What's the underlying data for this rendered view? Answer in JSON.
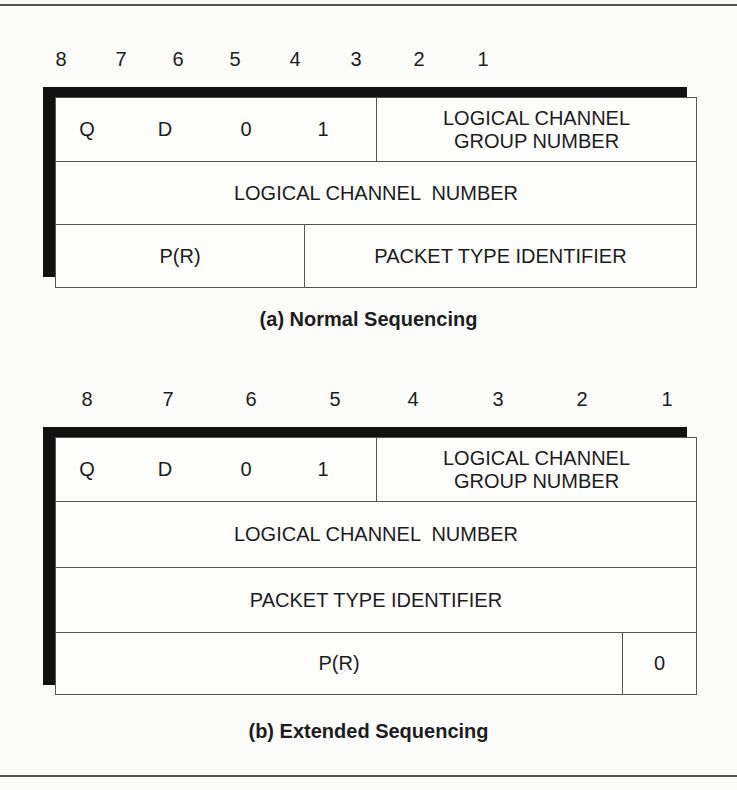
{
  "figure": {
    "bit_positions": [
      "8",
      "7",
      "6",
      "5",
      "4",
      "3",
      "2",
      "1"
    ],
    "normal": {
      "caption": "(a) Normal Sequencing",
      "row1": {
        "q": "Q",
        "d": "D",
        "bit6": "0",
        "bit5": "1",
        "group_label_line1": "LOGICAL CHANNEL",
        "group_label_line2": "GROUP NUMBER"
      },
      "row2": {
        "label": "LOGICAL CHANNEL  NUMBER"
      },
      "row3": {
        "pr": "P(R)",
        "pti": "PACKET TYPE IDENTIFIER"
      }
    },
    "extended": {
      "caption": "(b) Extended Sequencing",
      "row1": {
        "q": "Q",
        "d": "D",
        "bit6": "0",
        "bit5": "1",
        "group_label_line1": "LOGICAL CHANNEL",
        "group_label_line2": "GROUP NUMBER"
      },
      "row2": {
        "label": "LOGICAL CHANNEL  NUMBER"
      },
      "row3": {
        "label": "PACKET TYPE IDENTIFIER"
      },
      "row4": {
        "pr": "P(R)",
        "bit1": "0"
      }
    }
  }
}
